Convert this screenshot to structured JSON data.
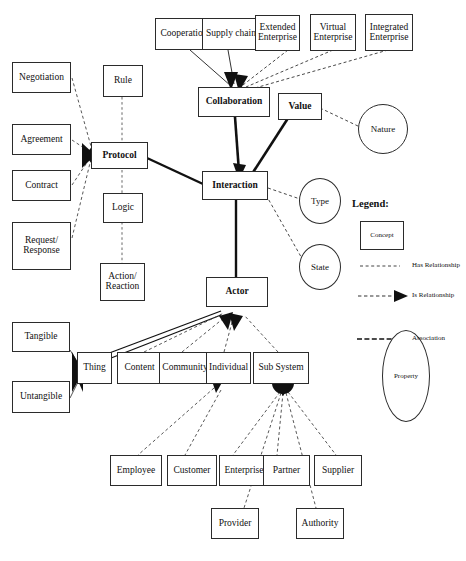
{
  "diagram": {
    "nodes": {
      "cooperation": "Cooperation",
      "supply_chain": "Supply chain",
      "extended_enterprise": "Extended Enterprise",
      "virtual_enterprise": "Virtual Enterprise",
      "integrated_enterprise": "Integrated Enterprise",
      "collaboration": "Collaboration",
      "value": "Value",
      "interaction": "Interaction",
      "actor": "Actor",
      "protocol": "Protocol",
      "rule": "Rule",
      "logic": "Logic",
      "action_reaction": "Action/ Reaction",
      "negotiation": "Negotiation",
      "agreement": "Agreement",
      "contract": "Contract",
      "request_response": "Request/ Response",
      "tangible": "Tangible",
      "untangible": "Untangible",
      "thing": "Thing",
      "content": "Content",
      "community": "Community",
      "individual": "Individual",
      "sub_system": "Sub System",
      "employee": "Employee",
      "customer": "Customer",
      "enterprise": "Enterprise",
      "partner": "Partner",
      "supplier": "Supplier",
      "provider": "Provider",
      "authority": "Authority"
    },
    "properties": {
      "nature": "Nature",
      "type": "Type",
      "state": "State"
    },
    "legend": {
      "title": "Legend:",
      "concept": "Concept",
      "has_relationship": "Has Relationship",
      "is_relationship": "Is Relationship",
      "association": "Association",
      "property": "Property"
    },
    "colors": {
      "stroke": "#2b2b2b",
      "fill": "#ffffff",
      "text": "#111111"
    }
  }
}
